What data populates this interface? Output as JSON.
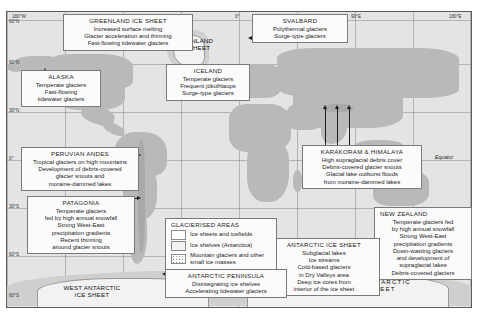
{
  "figure": {
    "equator_label": "Equator"
  },
  "axes": {
    "longitude_ticks": [
      "180°W",
      "0°",
      "90°E",
      "180°E"
    ],
    "latitude_ticks": [
      "60°N",
      "60°N",
      "30°N",
      "0°",
      "30°S",
      "60°S",
      "60°S"
    ]
  },
  "map_labels": [
    {
      "name": "greenland-ice-sheet",
      "lines": [
        "GREENLAND",
        "ICE SHEET"
      ]
    },
    {
      "name": "west-antarctic-ice-sheet",
      "lines": [
        "WEST ANTARCTIC",
        "ICE SHEET"
      ]
    },
    {
      "name": "east-antarctic-ice-sheet",
      "lines": [
        "EAST ANTARCTIC",
        "ICE SHEET"
      ]
    }
  ],
  "legend": {
    "header": "GLACIERISED AREAS",
    "items": [
      {
        "swatch": "ice-sheets-swatch",
        "label": "Ice sheets and icefields"
      },
      {
        "swatch": "ice-shelves-swatch",
        "label": "Ice shelves (Antarctica)"
      },
      {
        "swatch": "mountain-glaciers-swatch",
        "label": "Mountain glaciers and other small ice masses"
      }
    ]
  },
  "annotations": [
    {
      "id": "greenland",
      "header": "GREENLAND ICE SHEET",
      "lines": [
        "Increased surface melting",
        "Glacier acceleration and thinning",
        "Fast-flowing tidewater glaciers"
      ]
    },
    {
      "id": "svalbard",
      "header": "SVALBARD",
      "lines": [
        "Polythermal glaciers",
        "Surge-type glaciers"
      ]
    },
    {
      "id": "alaska",
      "header": "ALASKA",
      "lines": [
        "Temperate glaciers",
        "Fast-flowing",
        "tidewater glaciers"
      ]
    },
    {
      "id": "iceland",
      "header": "ICELAND",
      "lines": [
        "Temperate glaciers",
        "Frequent jökulhlaups",
        "Surge-type glaciers"
      ]
    },
    {
      "id": "peruvian-andes",
      "header": "PERUVIAN ANDES",
      "lines": [
        "Tropical glaciers on high mountains",
        "Development of debris-covered",
        "glacier snouts and",
        "moraine-dammed lakes"
      ]
    },
    {
      "id": "karakoram-himalaya",
      "header": "KARAKORAM & HIMALAYA",
      "lines": [
        "High supraglacial debris cover",
        "Debris-covered glacier snouts",
        "Glacial lake outburst floods",
        "from moraine-dammed lakes"
      ]
    },
    {
      "id": "patagonia",
      "header": "PATAGONIA",
      "lines": [
        "Temperate glaciers",
        "fed by high annual snowfall",
        "Strong West-East",
        "precipitation gradients",
        "Recent thinning",
        "around glacier snouts"
      ]
    },
    {
      "id": "new-zealand",
      "header": "NEW ZEALAND",
      "lines": [
        "Temperate glaciers fed",
        "by high annual snowfall",
        "Strong West-East",
        "precipitation gradients",
        "Down-wasting glaciers",
        "and development of",
        "supraglacial lakes",
        "Debris-covered glaciers"
      ]
    },
    {
      "id": "antarctic-ice-sheet",
      "header": "ANTARCTIC ICE SHEET",
      "lines": [
        "Subglacial lakes",
        "Ice streams",
        "Cold-based glaciers",
        "in Dry Valleys area",
        "Deep ice cores from",
        "interior of the ice sheet"
      ]
    },
    {
      "id": "antarctic-peninsula",
      "header": "ANTARCTIC PENINSULA",
      "lines": [
        "Disintegrating ice shelves",
        "Accelerating tidewater glaciers"
      ]
    }
  ]
}
